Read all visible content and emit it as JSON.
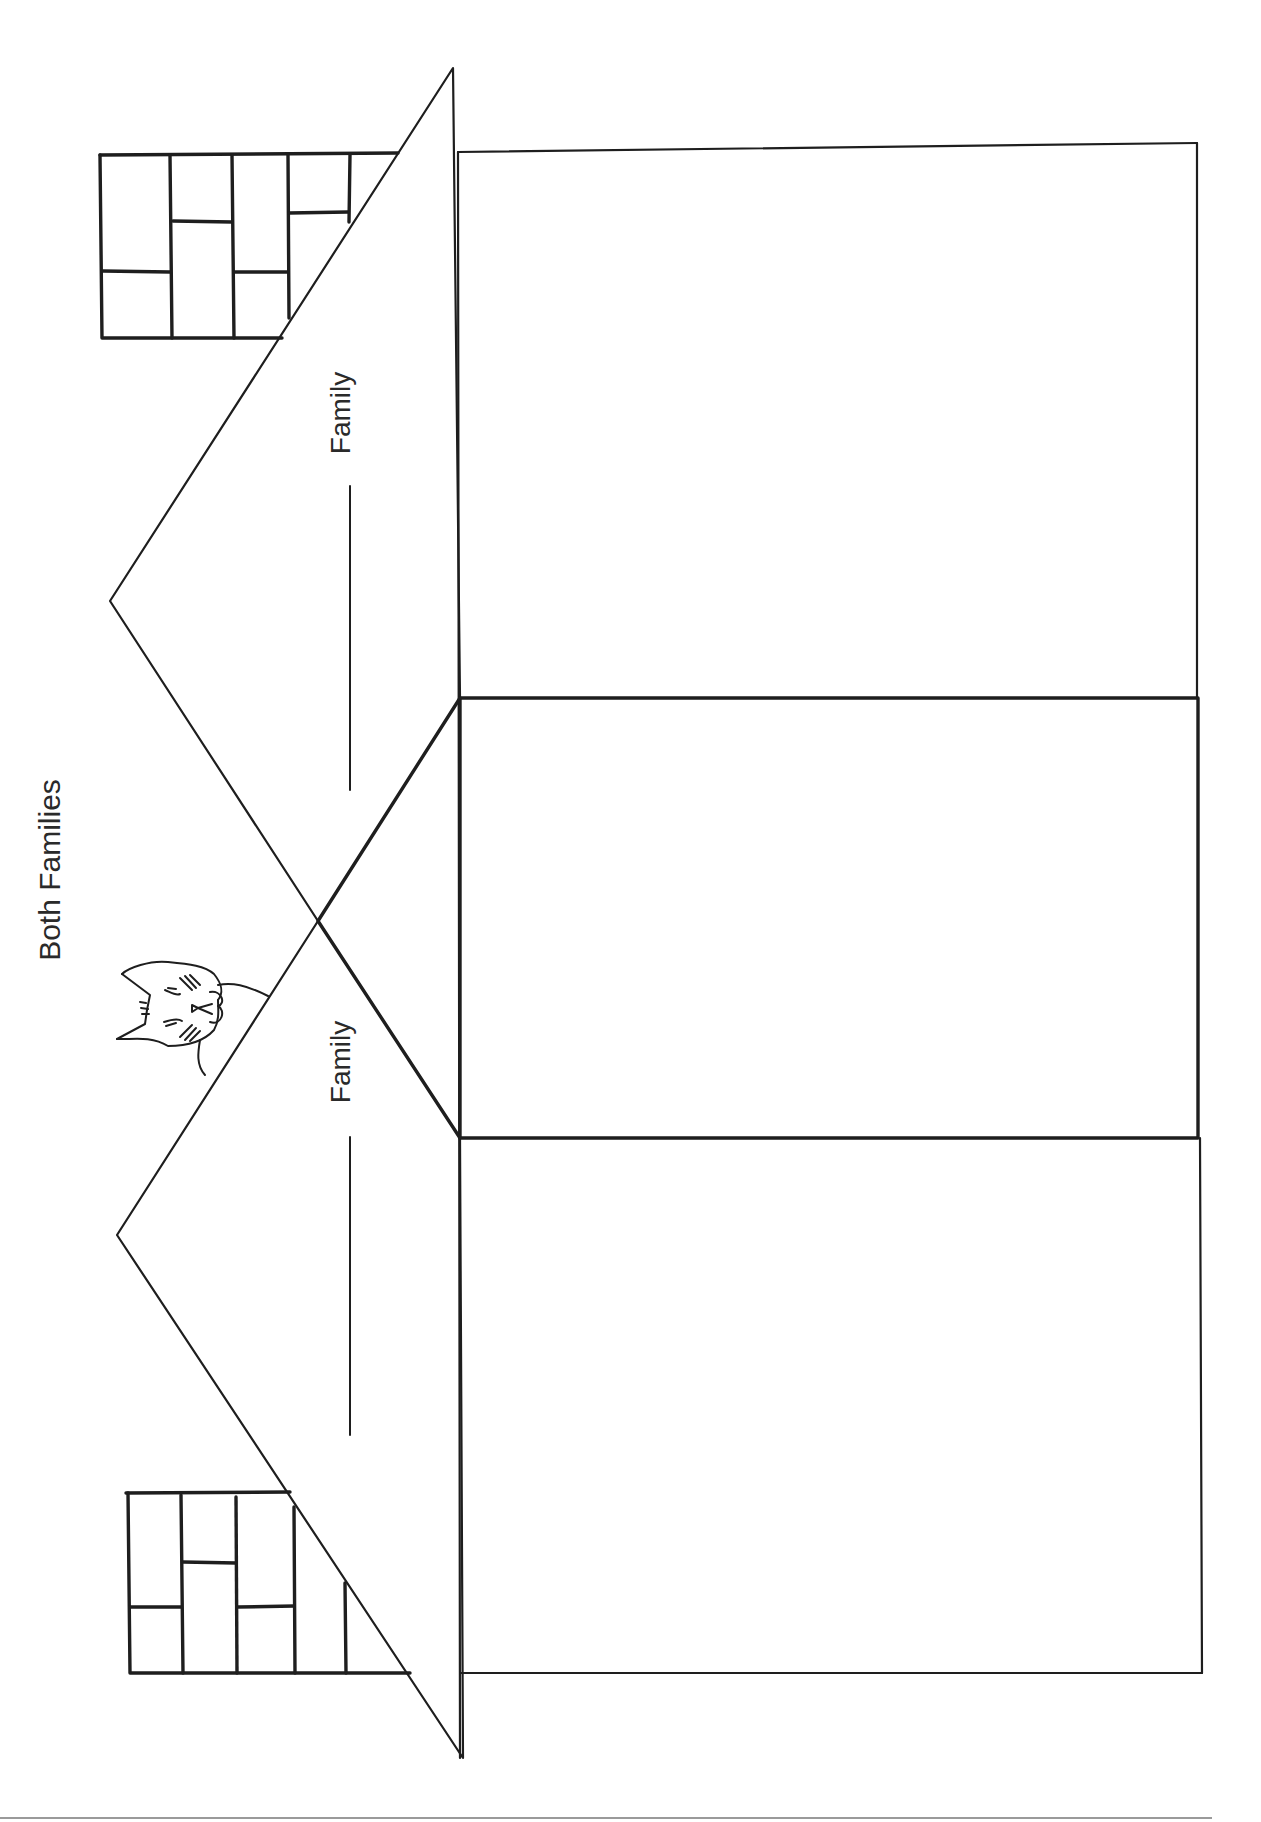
{
  "worksheet": {
    "title": "Both Families",
    "orientation": "rotated-90-ccw",
    "sections": [
      {
        "id": "family-a",
        "label": "Family",
        "blank": ""
      },
      {
        "id": "both",
        "label": "Both Families"
      },
      {
        "id": "family-b",
        "label": "Family",
        "blank": ""
      }
    ],
    "labels": {
      "top_family": "Family",
      "bottom_family": "Family"
    },
    "decorations": [
      "cat-peeking",
      "chimney-top",
      "chimney-bottom"
    ],
    "colors": {
      "ink": "#1e1e1e",
      "rule": "#9a9a9a",
      "paper": "#ffffff"
    }
  }
}
